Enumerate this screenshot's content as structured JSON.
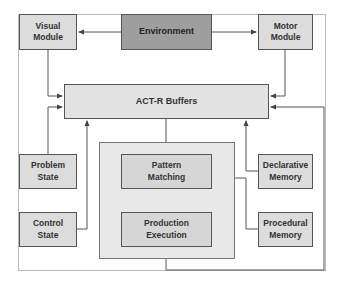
{
  "diagram": {
    "nodes": {
      "visual_module": "Visual\nModule",
      "environment": "Environment",
      "motor_module": "Motor\nModule",
      "act_r_buffers": "ACT-R Buffers",
      "pattern_matching": "Pattern\nMatching",
      "production_execution": "Production\nExecution",
      "problem_state": "Problem\nState",
      "control_state": "Control\nState",
      "declarative_memory": "Declarative\nMemory",
      "procedural_memory": "Procedural\nMemory"
    },
    "edges": [
      {
        "from": "environment",
        "to": "visual_module"
      },
      {
        "from": "environment",
        "to": "motor_module"
      },
      {
        "from": "visual_module",
        "to": "act_r_buffers"
      },
      {
        "from": "motor_module",
        "to": "act_r_buffers"
      },
      {
        "from": "problem_state",
        "to": "act_r_buffers"
      },
      {
        "from": "control_state",
        "to": "act_r_buffers"
      },
      {
        "from": "declarative_memory",
        "to": "act_r_buffers"
      },
      {
        "from": "act_r_buffers",
        "to": "pattern_matching"
      },
      {
        "from": "procedural_memory",
        "to": "pattern_matching"
      },
      {
        "from": "pattern_matching",
        "to": "production_execution"
      },
      {
        "from": "production_execution",
        "to": "act_r_buffers"
      }
    ],
    "colors": {
      "environment_fill": "#9e9e9e",
      "module_fill": "#dcdcdc",
      "container_fill": "#e8e8e8",
      "line": "#555555"
    }
  }
}
